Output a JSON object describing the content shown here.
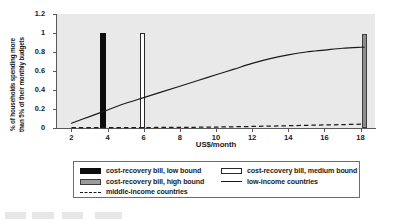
{
  "chart_data": {
    "type": "line",
    "title": "",
    "xlabel": "US$/month",
    "ylabel_line1": "% of households spending more",
    "ylabel_line2": "than 5% of their monthly budgets",
    "xlim": [
      1.2,
      18.8
    ],
    "ylim": [
      0,
      1.2
    ],
    "xticks": [
      2,
      4,
      6,
      8,
      10,
      12,
      14,
      16,
      18
    ],
    "yticks": [
      "0",
      "0.2",
      "0.4",
      "0.6",
      "0.8",
      "1",
      "1.2"
    ],
    "ytick_values": [
      0,
      0.2,
      0.4,
      0.6,
      0.8,
      1,
      1.2
    ],
    "grid": false,
    "plot_background": "#e9e9e9",
    "legend_position": "below",
    "series": [
      {
        "name": "low-income countries",
        "type": "line",
        "style": "solid",
        "color": "#1a1a1a",
        "x": [
          2,
          3,
          4,
          5,
          6,
          7,
          8,
          9,
          10,
          11,
          12,
          13,
          14,
          15,
          16,
          17,
          18,
          18.2
        ],
        "values": [
          0.05,
          0.12,
          0.19,
          0.26,
          0.32,
          0.38,
          0.44,
          0.5,
          0.56,
          0.62,
          0.68,
          0.73,
          0.77,
          0.8,
          0.82,
          0.84,
          0.85,
          0.85
        ]
      },
      {
        "name": "middle-income countries",
        "type": "line",
        "style": "dashed",
        "color": "#1a1a1a",
        "x": [
          2,
          4,
          6,
          8,
          9,
          10,
          11,
          12,
          13,
          14,
          15,
          16,
          17,
          18,
          18.2
        ],
        "values": [
          0.003,
          0.004,
          0.005,
          0.006,
          0.008,
          0.01,
          0.013,
          0.016,
          0.02,
          0.024,
          0.028,
          0.032,
          0.036,
          0.04,
          0.04
        ]
      },
      {
        "name": "cost-recovery bill, low bound",
        "type": "bar",
        "color": "#0d0d0d",
        "x": 3.75,
        "value": 1.0
      },
      {
        "name": "cost-recovery bill, medium bound",
        "type": "bar",
        "color": "#ffffff",
        "x": 5.95,
        "value": 1.0
      },
      {
        "name": "cost-recovery bill, high bound",
        "type": "bar",
        "color": "#8d8d8d",
        "x": 18.2,
        "value": 0.99
      }
    ],
    "legend": [
      {
        "label": "cost-recovery bill, low bound",
        "swatch": "black-bar"
      },
      {
        "label": "cost-recovery bill, medium bound",
        "swatch": "white-bar"
      },
      {
        "label": "cost-recovery bill, high bound",
        "swatch": "gray-bar"
      },
      {
        "label": "low-income countries",
        "swatch": "solid-line"
      },
      {
        "label": "middle-income countries",
        "swatch": "dashed-line"
      }
    ]
  }
}
